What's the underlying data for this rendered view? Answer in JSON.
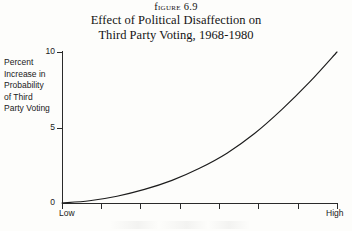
{
  "figure": {
    "number_label": "Figure 6.9",
    "title_line1": "Effect of Political Disaffection on",
    "title_line2": "Third Party Voting, 1968-1980"
  },
  "axes": {
    "y_caption_lines": [
      "Percent",
      "Increase in",
      "Probability",
      "of Third",
      "Party Voting"
    ],
    "y_ticks": [
      "10",
      "5",
      "0"
    ],
    "x_low_label": "Low",
    "x_high_label": "High"
  },
  "colors": {
    "ink": "#2a2a2a",
    "paper": "#fdfdfb",
    "curve": "#1c1c1c"
  },
  "chart_data": {
    "type": "line",
    "title": "Effect of Political Disaffection on Third Party Voting, 1968-1980",
    "xlabel": "Political Disaffection",
    "ylabel": "Percent Increase in Probability of Third Party Voting",
    "xlim": [
      0,
      10
    ],
    "ylim": [
      0,
      10
    ],
    "grid": false,
    "legend": null,
    "x_tick_labels": [
      "Low",
      "",
      "",
      "",
      "",
      "",
      "",
      "High"
    ],
    "y_tick_labels": [
      "0",
      "5",
      "10"
    ],
    "y_ticks": [
      0,
      5,
      10
    ],
    "series": [
      {
        "name": "Probability increase",
        "x": [
          0,
          1,
          2,
          3,
          4,
          5,
          6,
          7,
          8,
          9,
          10
        ],
        "values": [
          0.0,
          0.15,
          0.45,
          0.9,
          1.5,
          2.3,
          3.3,
          4.6,
          6.2,
          8.0,
          10.0
        ]
      }
    ],
    "annotations": []
  }
}
